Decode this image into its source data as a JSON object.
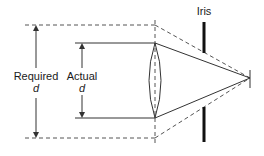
{
  "diagram": {
    "labels": {
      "iris": "Iris",
      "required_line1": "Required",
      "required_line2": "d",
      "actual_line1": "Actual",
      "actual_line2": "d"
    },
    "colors": {
      "line": "#333333",
      "dashed": "#555555",
      "iris": "#111111",
      "background": "#ffffff"
    },
    "elements": [
      {
        "name": "lens",
        "type": "biconvex lens"
      },
      {
        "name": "iris",
        "type": "aperture stop"
      },
      {
        "name": "focal-point",
        "type": "image point"
      },
      {
        "name": "required-diameter",
        "type": "dashed ray bundle"
      },
      {
        "name": "actual-diameter",
        "type": "solid ray bundle"
      }
    ]
  }
}
